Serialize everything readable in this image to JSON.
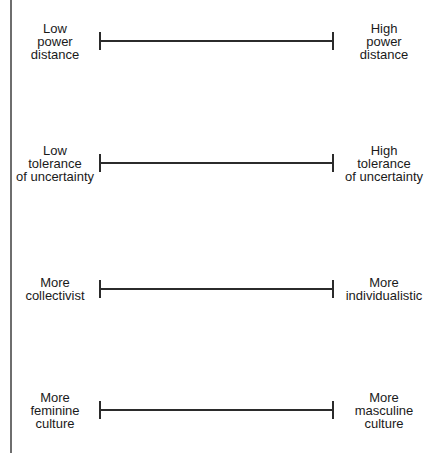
{
  "diagram": {
    "type": "bipolar-scales",
    "line_color": "#2b2b2b",
    "frame_rule_color": "#6e6e6e",
    "scales": [
      {
        "name": "power-distance",
        "left_label": "Low\npower\ndistance",
        "right_label": "High\npower\ndistance"
      },
      {
        "name": "uncertainty-tolerance",
        "left_label": "Low\ntolerance\nof uncertainty",
        "right_label": "High\ntolerance\nof uncertainty"
      },
      {
        "name": "collectivism-individualism",
        "left_label": "More\ncollectivist",
        "right_label": "More\nindividualistic"
      },
      {
        "name": "femininity-masculinity",
        "left_label": "More\nfeminine\nculture",
        "right_label": "More\nmasculine\nculture"
      }
    ]
  }
}
